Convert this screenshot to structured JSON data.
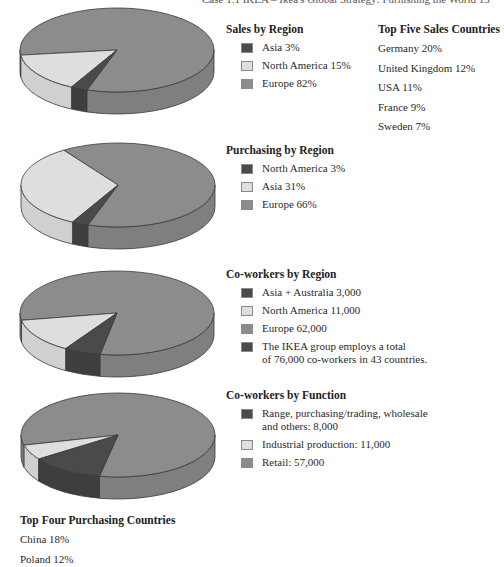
{
  "header": {
    "text": "Case 1.1  IKEA – Ikea's Global Strategy: Furnishing the World     13"
  },
  "colors": {
    "dark": "#4a4a4a",
    "light": "#dedede",
    "mid": "#8c8c8c",
    "dark_side": "#3e3e3e",
    "light_side": "#d0d0d0",
    "mid_side": "#7f7f7f",
    "outline": "#3a3a3a"
  },
  "sales_by_region": {
    "title": "Sales by Region",
    "items": [
      {
        "label": "Asia 3%",
        "swatch": "dark"
      },
      {
        "label": "North America 15%",
        "swatch": "light"
      },
      {
        "label": "Europe 82%",
        "swatch": "mid"
      }
    ]
  },
  "top_five_sales": {
    "title": "Top Five Sales Countries",
    "rows": [
      "Germany 20%",
      "United Kingdom 12%",
      "USA 11%",
      "France 9%",
      "Sweden 7%"
    ]
  },
  "purchasing_by_region": {
    "title": "Purchasing by Region",
    "items": [
      {
        "label": "North America 3%",
        "swatch": "dark"
      },
      {
        "label": "Asia 31%",
        "swatch": "light"
      },
      {
        "label": "Europe 66%",
        "swatch": "mid"
      }
    ]
  },
  "coworkers_by_region": {
    "title": "Co-workers by Region",
    "items": [
      {
        "label": "Asia + Australia 3,000",
        "swatch": "dark"
      },
      {
        "label": "North America 11,000",
        "swatch": "light"
      },
      {
        "label": "Europe 62,000",
        "swatch": "mid"
      },
      {
        "label": "The IKEA group employs a total",
        "label2": "of 76,000 co-workers in 43 countries.",
        "swatch": "dark"
      }
    ]
  },
  "coworkers_by_function": {
    "title": "Co-workers by Function",
    "items": [
      {
        "label": "Range, purchasing/trading, wholesale",
        "label2": "and others: 8,000",
        "swatch": "dark"
      },
      {
        "label": "Industrial production: 11,000",
        "swatch": "light"
      },
      {
        "label": "Retail: 57,000",
        "swatch": "mid"
      }
    ]
  },
  "top_four_purchasing": {
    "title": "Top Four Purchasing Countries",
    "rows": [
      "China 18%",
      "Poland 12%"
    ]
  },
  "chart_data": [
    {
      "type": "pie",
      "title": "Sales by Region",
      "categories": [
        "Asia",
        "North America",
        "Europe"
      ],
      "values": [
        3,
        15,
        82
      ],
      "unit": "%"
    },
    {
      "type": "pie",
      "title": "Purchasing by Region",
      "categories": [
        "North America",
        "Asia",
        "Europe"
      ],
      "values": [
        3,
        31,
        66
      ],
      "unit": "%"
    },
    {
      "type": "pie",
      "title": "Co-workers by Region",
      "categories": [
        "Asia + Australia",
        "North America",
        "Europe"
      ],
      "values": [
        3000,
        11000,
        62000
      ],
      "note": "The IKEA group employs a total of 76,000 co-workers in 43 countries."
    },
    {
      "type": "pie",
      "title": "Co-workers by Function",
      "categories": [
        "Range, purchasing/trading, wholesale and others",
        "Industrial production",
        "Retail"
      ],
      "values": [
        8000,
        11000,
        57000
      ]
    },
    {
      "type": "table",
      "title": "Top Five Sales Countries",
      "categories": [
        "Germany",
        "United Kingdom",
        "USA",
        "France",
        "Sweden"
      ],
      "values": [
        20,
        12,
        11,
        9,
        7
      ],
      "unit": "%"
    },
    {
      "type": "table",
      "title": "Top Four Purchasing Countries",
      "categories": [
        "China",
        "Poland"
      ],
      "values": [
        18,
        12
      ],
      "unit": "%"
    }
  ],
  "pies": [
    {
      "cx": 117,
      "cy": 50,
      "rx": 97,
      "ry": 42,
      "depth": 22,
      "light": [
        118,
        173
      ],
      "dark": [
        108,
        118
      ]
    },
    {
      "cx": 118,
      "cy": 185,
      "rx": 97,
      "ry": 42,
      "depth": 22,
      "light": [
        118,
        236
      ],
      "dark": [
        108,
        118
      ]
    },
    {
      "cx": 117,
      "cy": 313,
      "rx": 97,
      "ry": 42,
      "depth": 22,
      "light": [
        122,
        170
      ],
      "dark": [
        100,
        122
      ]
    },
    {
      "cx": 118,
      "cy": 435,
      "rx": 97,
      "ry": 42,
      "depth": 22,
      "light": [
        145,
        166
      ],
      "dark": [
        101,
        145
      ]
    }
  ]
}
